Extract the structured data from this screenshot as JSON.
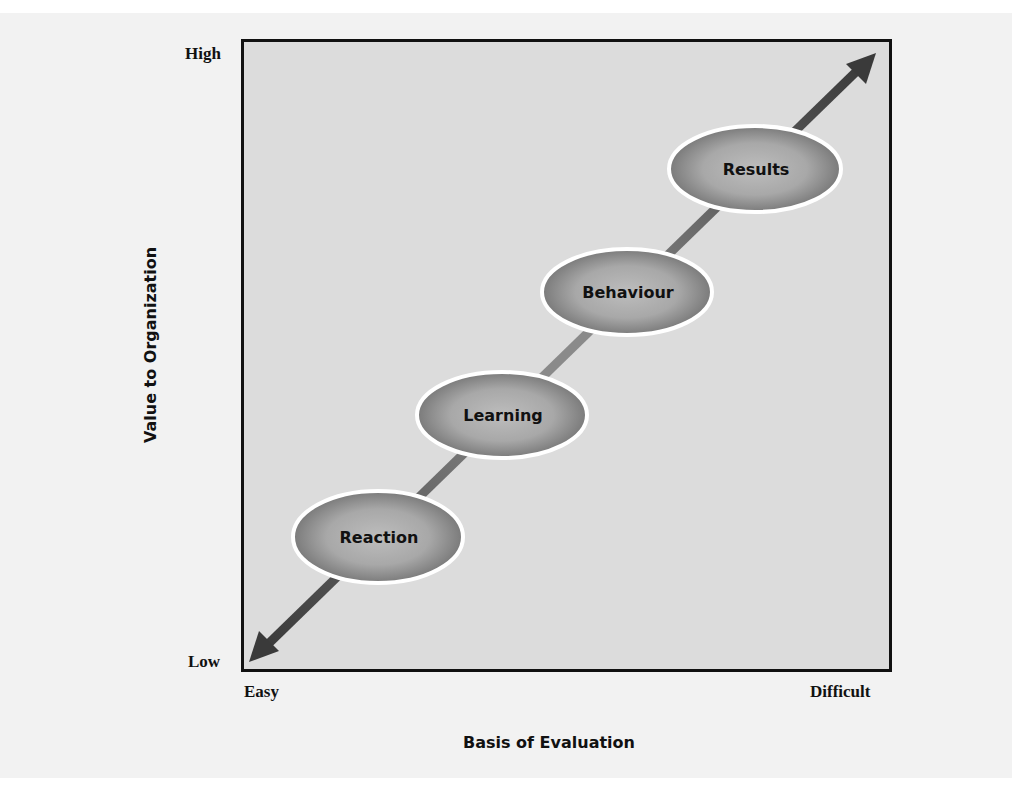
{
  "diagram": {
    "type": "evaluation-levels-diagram",
    "y_axis": {
      "title": "Value to Organization",
      "high_label": "High",
      "low_label": "Low"
    },
    "x_axis": {
      "title": "Basis of Evaluation",
      "easy_label": "Easy",
      "difficult_label": "Difficult"
    },
    "levels": [
      {
        "label": "Reaction",
        "order": 1
      },
      {
        "label": "Learning",
        "order": 2
      },
      {
        "label": "Behaviour",
        "order": 3
      },
      {
        "label": "Results",
        "order": 4
      }
    ],
    "arrow": {
      "direction": "bidirectional-diagonal",
      "from": "Low/Easy",
      "to": "High/Difficult"
    },
    "colors": {
      "plot_fill": "#dcdcdc",
      "ellipse_center": "#b9b9b9",
      "ellipse_edge": "#6f6f6f",
      "ellipse_outline": "#ffffff",
      "arrow": "#3a3a3a",
      "border": "#111111"
    }
  }
}
